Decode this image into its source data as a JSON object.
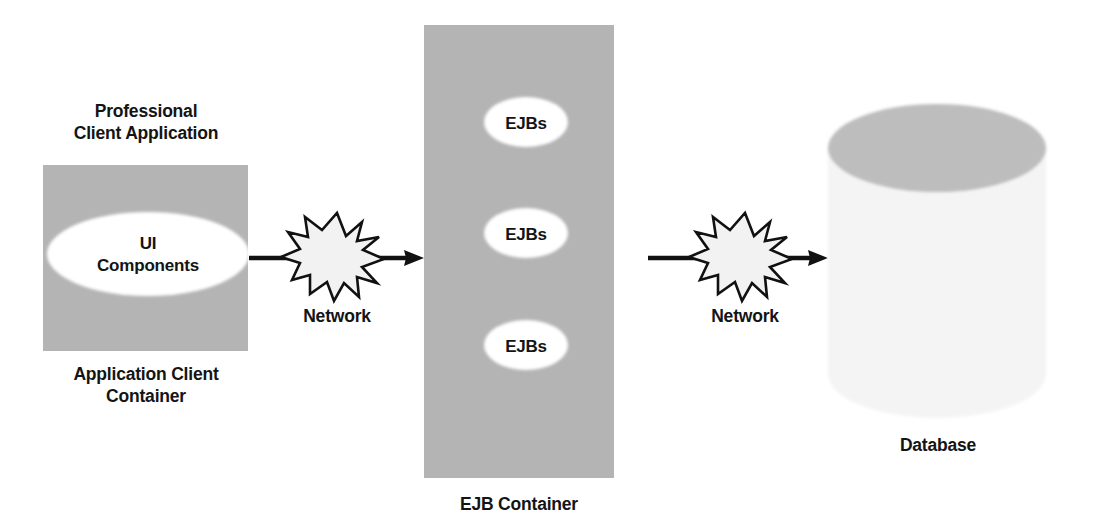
{
  "diagram": {
    "background_color": "#ffffff",
    "palette": {
      "container_fill": "#b4b4b4",
      "client_box_fill": "#b4b4b4",
      "node_fill": "#ffffff",
      "cylinder_body_fill": "#f4f4f4",
      "cylinder_top_fill": "#bdbdbd",
      "burst_fill": "#f2f2f2",
      "line_color": "#111111",
      "text_color": "#141414"
    },
    "tiers": [
      {
        "id": "client-tier",
        "title_lines": [
          "Professional",
          "Client Application"
        ],
        "caption_lines": [
          "Application Client",
          "Container"
        ],
        "node_lines": [
          "UI",
          "Components"
        ]
      },
      {
        "id": "business-tier",
        "caption_lines": [
          "EJB Container"
        ],
        "beans": [
          {
            "label": "EJBs"
          },
          {
            "label": "EJBs"
          },
          {
            "label": "EJBs"
          }
        ]
      },
      {
        "id": "data-tier",
        "caption_lines": [
          "Database"
        ]
      }
    ],
    "connectors": [
      {
        "id": "client-to-ejb",
        "label": "Network",
        "icon": "network-burst-icon",
        "direction": "right"
      },
      {
        "id": "ejb-to-database",
        "label": "Network",
        "icon": "network-burst-icon",
        "direction": "right"
      }
    ]
  }
}
